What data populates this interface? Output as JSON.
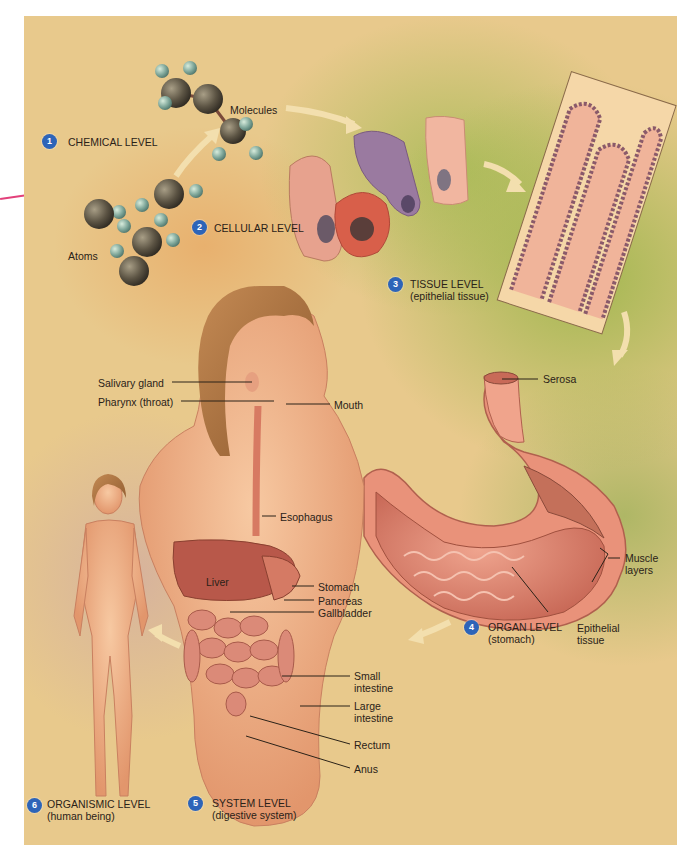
{
  "figure": {
    "colors": {
      "badge": "#2d64b8",
      "background_tan": "#e8c98c",
      "background_green": "#a8bf5a",
      "tissue_pink": "#e8a088",
      "arrow": "#f3dfae"
    }
  },
  "levels": [
    {
      "number": "1",
      "title": "CHEMICAL LEVEL",
      "subtitle": ""
    },
    {
      "number": "2",
      "title": "CELLULAR LEVEL",
      "subtitle": ""
    },
    {
      "number": "3",
      "title": "TISSUE LEVEL",
      "subtitle": "(epithelial tissue)"
    },
    {
      "number": "4",
      "title": "ORGAN LEVEL",
      "subtitle": "(stomach)"
    },
    {
      "number": "5",
      "title": "SYSTEM LEVEL",
      "subtitle": "(digestive system)"
    },
    {
      "number": "6",
      "title": "ORGANISMIC LEVEL",
      "subtitle": "(human being)"
    }
  ],
  "chemical_labels": {
    "molecules": "Molecules",
    "atoms": "Atoms"
  },
  "stomach_labels": {
    "serosa": "Serosa",
    "muscle_layers": "Muscle layers",
    "epithelial_tissue": "Epithelial tissue"
  },
  "system_labels": {
    "salivary_gland": "Salivary gland",
    "pharynx": "Pharynx (throat)",
    "mouth": "Mouth",
    "esophagus": "Esophagus",
    "liver": "Liver",
    "stomach": "Stomach",
    "pancreas": "Pancreas",
    "gallbladder": "Gallbladder",
    "small_intestine": "Small intestine",
    "large_intestine": "Large intestine",
    "rectum": "Rectum",
    "anus": "Anus"
  }
}
